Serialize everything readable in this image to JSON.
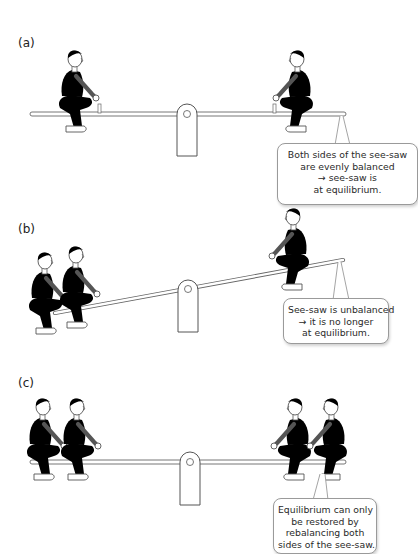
{
  "panels": [
    {
      "label": "(a)",
      "state": "balanced",
      "callout": [
        "Both sides of the see-saw",
        "are evenly balanced",
        "→ see-saw is",
        "at equilibrium."
      ]
    },
    {
      "label": "(b)",
      "state": "unbalanced",
      "callout": [
        "See-saw is unbalanced",
        "→ it is no longer",
        "at equilibrium."
      ]
    },
    {
      "label": "(c)",
      "state": "rebalanced",
      "callout": [
        "Equilibrium can only",
        "be restored by",
        "rebalancing both",
        "sides of the see-saw."
      ]
    }
  ],
  "colors": {
    "line": "#555555",
    "shirt_grey": "#b5b5b5",
    "shirt_black": "#1a1a1a",
    "trousers_dark": "#8a8a8a",
    "trousers_light": "#d8d8d8",
    "hair_dark": "#222222",
    "hair_mid": "#999999",
    "hair_light": "#e6e6e6"
  }
}
